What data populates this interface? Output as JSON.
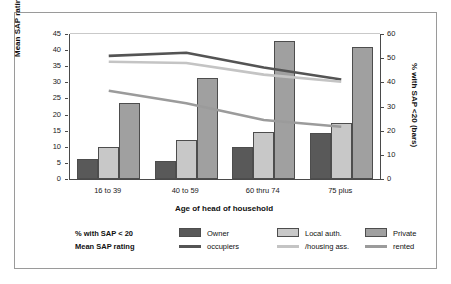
{
  "chart_data": {
    "type": "bar",
    "title": "",
    "subtitle": "",
    "xlabel": "Age of head of household",
    "ylabel": "Mean SAP rating (lines)",
    "y2label": "% with SAP <20 (bars)",
    "categories": [
      "16 to 39",
      "40 to 59",
      "60 thru 74",
      "75 plus"
    ],
    "ylim": [
      0,
      45
    ],
    "yticks": [
      0,
      5,
      10,
      15,
      20,
      25,
      30,
      35,
      40,
      45
    ],
    "y2lim": [
      0,
      60
    ],
    "y2ticks": [
      0,
      10,
      20,
      30,
      40,
      50,
      60
    ],
    "grid": false,
    "legend_position": "bottom",
    "bar_series": [
      {
        "name": "Owner occupiers",
        "axis": "right",
        "unit": "% with SAP < 20",
        "color": "#595959",
        "values": [
          8.3,
          7.6,
          13.1,
          19.2
        ]
      },
      {
        "name": "Local auth. /housing ass.",
        "axis": "right",
        "unit": "% with SAP < 20",
        "color": "#c8c8c8",
        "values": [
          13.2,
          16.3,
          19.6,
          23.1
        ]
      },
      {
        "name": "Private rented",
        "axis": "right",
        "unit": "% with SAP < 20",
        "color": "#a0a0a0",
        "values": [
          31.6,
          41.6,
          57.0,
          54.8
        ]
      }
    ],
    "line_series": [
      {
        "name": "Owner occupiers",
        "axis": "left",
        "unit": "Mean SAP rating",
        "color": "#545454",
        "values": [
          38.2,
          39.2,
          34.6,
          30.9
        ]
      },
      {
        "name": "Local auth. /housing ass.",
        "axis": "left",
        "unit": "Mean SAP rating",
        "color": "#c4c4c4",
        "values": [
          36.4,
          36.0,
          32.4,
          30.2
        ]
      },
      {
        "name": "Private rented",
        "axis": "left",
        "unit": "Mean SAP rating",
        "color": "#9b9b9b",
        "values": [
          27.4,
          23.5,
          18.3,
          16.2
        ]
      }
    ]
  },
  "axes": {
    "left": {
      "label": "Mean SAP rating (lines)",
      "ticks": [
        "0",
        "5",
        "10",
        "15",
        "20",
        "25",
        "30",
        "35",
        "40",
        "45"
      ]
    },
    "right": {
      "label": "% with SAP <20 (bars)",
      "ticks": [
        "0",
        "10",
        "20",
        "30",
        "40",
        "50",
        "60"
      ]
    },
    "bottom": {
      "label": "Age of head of household",
      "ticks": [
        "16 to 39",
        "40 to 59",
        "60 thru 74",
        "75 plus"
      ]
    }
  },
  "legend": {
    "row_labels": [
      "% with SAP < 20",
      "Mean SAP rating"
    ],
    "entries": [
      {
        "bar_label": "Owner",
        "line_label": "occupiers",
        "bar_color": "#595959",
        "line_color": "#545454"
      },
      {
        "bar_label": "Local auth.",
        "line_label": "/housing ass.",
        "bar_color": "#c8c8c8",
        "line_color": "#c4c4c4"
      },
      {
        "bar_label": "Private",
        "line_label": "rented",
        "bar_color": "#a0a0a0",
        "line_color": "#9b9b9b"
      }
    ]
  }
}
